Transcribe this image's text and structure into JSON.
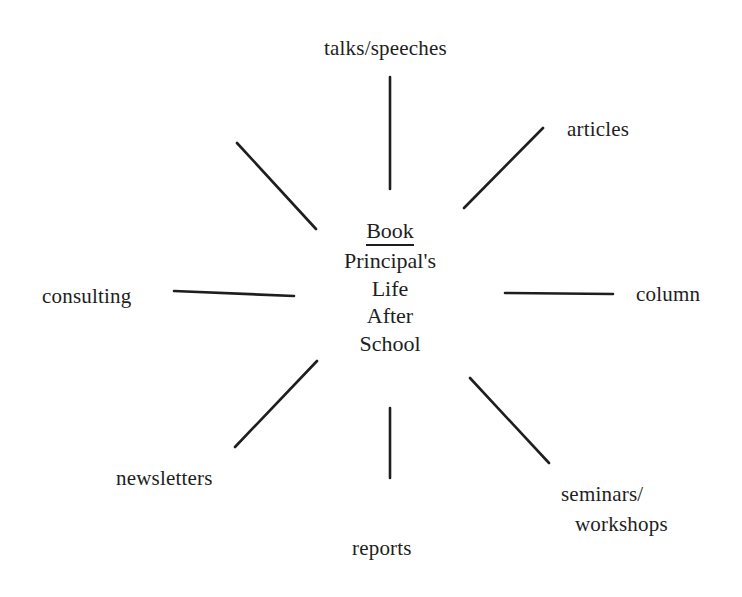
{
  "diagram": {
    "type": "spider / mind-map",
    "center": {
      "title": "Book",
      "lines": [
        "Principal's",
        "Life",
        "After",
        "School"
      ]
    },
    "spokes": [
      {
        "id": "top",
        "label": "talks/speeches",
        "x1": 390,
        "y1": 77,
        "x2": 390,
        "y2": 189
      },
      {
        "id": "upper-right",
        "label": "articles",
        "x1": 543,
        "y1": 128,
        "x2": 464,
        "y2": 208
      },
      {
        "id": "right",
        "label": "column",
        "x1": 505,
        "y1": 293,
        "x2": 613,
        "y2": 294
      },
      {
        "id": "lower-right",
        "label_lines": [
          "seminars/",
          "workshops"
        ],
        "x1": 470,
        "y1": 378,
        "x2": 549,
        "y2": 463
      },
      {
        "id": "bottom",
        "label": "reports",
        "x1": 390,
        "y1": 408,
        "x2": 390,
        "y2": 478
      },
      {
        "id": "lower-left",
        "label": "newsletters",
        "x1": 317,
        "y1": 361,
        "x2": 235,
        "y2": 447
      },
      {
        "id": "left",
        "label": "consulting",
        "x1": 174,
        "y1": 291,
        "x2": 294,
        "y2": 296
      },
      {
        "id": "upper-left",
        "label": "",
        "x1": 237,
        "y1": 143,
        "x2": 316,
        "y2": 229
      }
    ]
  },
  "colors": {
    "ink": "#1e1e1e",
    "background": "#ffffff"
  }
}
